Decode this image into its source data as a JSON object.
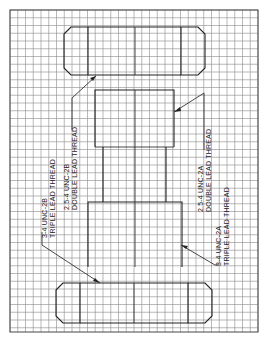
{
  "drawing": {
    "title": "Multiple lead thread assembly",
    "labels": {
      "left_outer": {
        "line1": "3-4 UNC-2B",
        "line2": "TRIPLE LEAD THREAD"
      },
      "left_inner": {
        "line1": "2.5-4 UNC-2B",
        "line2": "DOUBLE LEAD THREAD"
      },
      "right_inner": {
        "line1": "2.5-4 UNC-2A",
        "line2": "DOUBLE LEAD THREAD"
      },
      "right_outer": {
        "line1": "3-4 UNC-2A",
        "line2": "TRIPLE LEAD THREAD"
      }
    },
    "colors": {
      "background": "#ffffff",
      "grid": "#8a8a8a",
      "lines": "#222222"
    }
  }
}
